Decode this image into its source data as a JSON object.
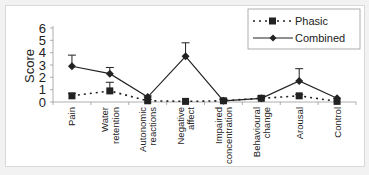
{
  "chart_data": {
    "type": "line",
    "title": "",
    "xlabel": "",
    "ylabel": "Score",
    "ylim": [
      0,
      6
    ],
    "yticks": [
      0,
      1,
      2,
      3,
      4,
      5,
      6
    ],
    "grid": false,
    "legend_position": "top-right",
    "categories": [
      [
        "Pain"
      ],
      [
        "Water",
        "retention"
      ],
      [
        "Autonomic",
        "reactions"
      ],
      [
        "Negative",
        "affect"
      ],
      [
        "Impaired",
        "concentration"
      ],
      [
        "Behavioural",
        "change"
      ],
      [
        "Arousal"
      ],
      [
        "Control"
      ]
    ],
    "series": [
      {
        "name": "Phasic",
        "style": "dotted",
        "marker": "square",
        "values": [
          0.5,
          0.9,
          0.1,
          0.05,
          0.1,
          0.3,
          0.5,
          0.05
        ],
        "error_upper": [
          0.7,
          1.6,
          0.2,
          0.05,
          0.2,
          0.4,
          0.6,
          0.05
        ]
      },
      {
        "name": "Combined",
        "style": "solid",
        "marker": "diamond",
        "values": [
          2.9,
          2.3,
          0.4,
          3.7,
          0.1,
          0.3,
          1.7,
          0.3
        ],
        "error_upper": [
          3.8,
          2.8,
          0.5,
          4.8,
          0.25,
          0.5,
          2.7,
          0.3
        ]
      }
    ]
  },
  "legend": {
    "phasic_label": "Phasic",
    "combined_label": "Combined"
  },
  "axis": {
    "ylabel": "Score"
  }
}
